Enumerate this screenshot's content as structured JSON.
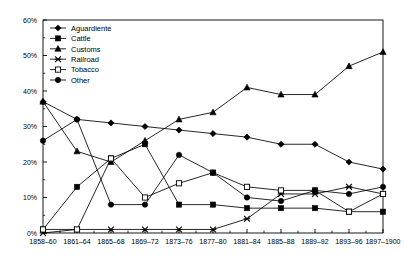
{
  "chart_data": {
    "type": "line",
    "title": "",
    "subtitle": "",
    "xlabel": "",
    "ylabel": "",
    "ylim": [
      0,
      60
    ],
    "ytick_labels": [
      "0%",
      "10%",
      "20%",
      "30%",
      "40%",
      "50%",
      "60%"
    ],
    "ytick_values": [
      0,
      10,
      20,
      30,
      40,
      50,
      60
    ],
    "minor_ticks": true,
    "grid": false,
    "legend_position": "top-left",
    "categories": [
      "1858–60",
      "1861–64",
      "1865–68",
      "1869–72",
      "1873–76",
      "1877–80",
      "1881–84",
      "1885–88",
      "1889–92",
      "1893–96",
      "1897–1900"
    ],
    "series": [
      {
        "name": "Aguardiente",
        "marker": "diamond",
        "values": [
          37,
          32,
          31,
          30,
          29,
          28,
          27,
          25,
          25,
          20,
          18
        ]
      },
      {
        "name": "Cattle",
        "marker": "square-filled",
        "values": [
          1,
          13,
          21,
          25,
          8,
          8,
          7,
          7,
          7,
          6,
          6
        ]
      },
      {
        "name": "Customs",
        "marker": "triangle",
        "values": [
          37,
          23,
          20,
          26,
          32,
          34,
          41,
          39,
          39,
          47,
          51
        ]
      },
      {
        "name": "Railroad",
        "marker": "asterisk",
        "values": [
          0,
          1,
          1,
          1,
          1,
          1,
          4,
          11,
          11,
          13,
          11
        ]
      },
      {
        "name": "Tobacco",
        "marker": "square-open",
        "values": [
          1,
          1,
          21,
          10,
          14,
          17,
          13,
          12,
          12,
          6,
          11
        ]
      },
      {
        "name": "Other",
        "marker": "circle",
        "values": [
          26,
          32,
          8,
          8,
          22,
          17,
          10,
          9,
          12,
          11,
          13
        ]
      }
    ]
  },
  "legend": {
    "items": [
      {
        "label": "Aguardiente",
        "marker": "diamond"
      },
      {
        "label": "Cattle",
        "marker": "square-filled"
      },
      {
        "label": "Customs",
        "marker": "triangle"
      },
      {
        "label": "Railroad",
        "marker": "asterisk"
      },
      {
        "label": "Tobacco",
        "marker": "square-open"
      },
      {
        "label": "Other",
        "marker": "circle"
      }
    ]
  },
  "colors": {
    "line": "#000000",
    "axis": "#000000",
    "background": "#ffffff"
  }
}
